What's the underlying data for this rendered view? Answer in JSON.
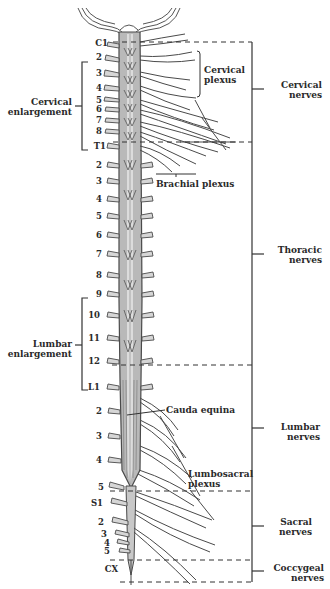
{
  "diagram": {
    "type": "anatomical",
    "segment_labels": [
      {
        "id": "c1",
        "text": "C1",
        "y": 42
      },
      {
        "id": "c2",
        "text": "2",
        "y": 57
      },
      {
        "id": "c3",
        "text": "3",
        "y": 73
      },
      {
        "id": "c4",
        "text": "4",
        "y": 87
      },
      {
        "id": "c5",
        "text": "5",
        "y": 99
      },
      {
        "id": "c6",
        "text": "6",
        "y": 108
      },
      {
        "id": "c7",
        "text": "7",
        "y": 119
      },
      {
        "id": "c8",
        "text": "8",
        "y": 130
      },
      {
        "id": "t1",
        "text": "T1",
        "y": 145
      },
      {
        "id": "t2",
        "text": "2",
        "y": 164
      },
      {
        "id": "t3",
        "text": "3",
        "y": 180
      },
      {
        "id": "t4",
        "text": "4",
        "y": 198
      },
      {
        "id": "t5",
        "text": "5",
        "y": 215
      },
      {
        "id": "t6",
        "text": "6",
        "y": 234
      },
      {
        "id": "t7",
        "text": "7",
        "y": 253
      },
      {
        "id": "t8",
        "text": "8",
        "y": 274
      },
      {
        "id": "t9",
        "text": "9",
        "y": 293
      },
      {
        "id": "t10",
        "text": "10",
        "y": 314
      },
      {
        "id": "t11",
        "text": "11",
        "y": 337
      },
      {
        "id": "t12",
        "text": "12",
        "y": 360
      },
      {
        "id": "l1",
        "text": "L1",
        "y": 386
      },
      {
        "id": "l2",
        "text": "2",
        "y": 410
      },
      {
        "id": "l3",
        "text": "3",
        "y": 435
      },
      {
        "id": "l4",
        "text": "4",
        "y": 459
      },
      {
        "id": "l5",
        "text": "5",
        "y": 486
      },
      {
        "id": "s1",
        "text": "S1",
        "y": 502
      },
      {
        "id": "s2",
        "text": "2",
        "y": 521
      },
      {
        "id": "s3",
        "text": "3",
        "y": 533
      },
      {
        "id": "s4",
        "text": "4",
        "y": 542
      },
      {
        "id": "s5",
        "text": "5",
        "y": 550
      },
      {
        "id": "cx",
        "text": "CX",
        "y": 568
      }
    ],
    "left_annotations": {
      "cervical_enlargement": {
        "line1": "Cervical",
        "line2": "enlargement"
      },
      "lumbar_enlargement": {
        "line1": "Lumbar",
        "line2": "enlargement"
      }
    },
    "inner_annotations": {
      "cervical_plexus": {
        "line1": "Cervical",
        "line2": "plexus"
      },
      "brachial_plexus": "Brachial plexus",
      "cauda_equina": "Cauda equina",
      "lumbosacral_plexus": {
        "line1": "Lumbosacral",
        "line2": "plexus"
      }
    },
    "right_groups": [
      {
        "id": "cervical",
        "line1": "Cervical",
        "line2": "nerves"
      },
      {
        "id": "thoracic",
        "line1": "Thoracic",
        "line2": "nerves"
      },
      {
        "id": "lumbar",
        "line1": "Lumbar",
        "line2": "nerves"
      },
      {
        "id": "sacral",
        "line1": "Sacral",
        "line2": "nerves"
      },
      {
        "id": "coccygeal",
        "line1": "Coccygeal",
        "line2": "nerves"
      }
    ],
    "colors": {
      "cord_fill": "#b9b9b9",
      "cord_center": "#dcdcdc",
      "outline": "#4a4a4a",
      "nerve_fill": "#d6d6d6",
      "text": "#2a2a2a",
      "background": "#ffffff"
    }
  }
}
